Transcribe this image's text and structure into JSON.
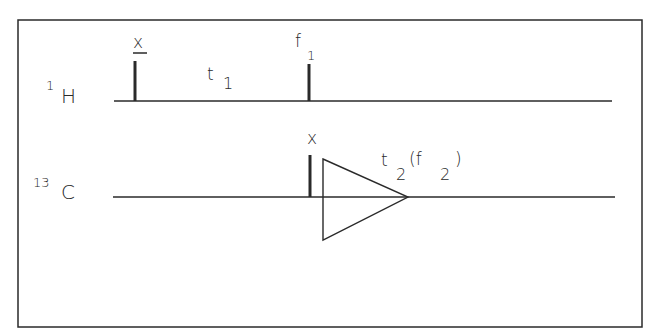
{
  "diagram": {
    "type": "nmr-pulse-sequence",
    "colors": {
      "stroke": "#2a2a2a",
      "background": "#ffffff"
    },
    "channels": [
      {
        "id": "1H",
        "isotope_mass": "1",
        "element": "H",
        "events": [
          {
            "kind": "pulse",
            "phase_label": "x",
            "phase_overbar": true
          },
          {
            "kind": "delay",
            "label_main": "t",
            "label_sub": "1"
          },
          {
            "kind": "pulse",
            "phase_label": "f",
            "phase_sub": "1"
          }
        ]
      },
      {
        "id": "13C",
        "isotope_mass": "13",
        "element": "C",
        "events": [
          {
            "kind": "pulse",
            "phase_label": "x"
          },
          {
            "kind": "acquisition",
            "label_main": "t",
            "label_sub": "2",
            "paren_main": "(f",
            "paren_sub": "2",
            "paren_close": ")"
          }
        ]
      }
    ]
  }
}
